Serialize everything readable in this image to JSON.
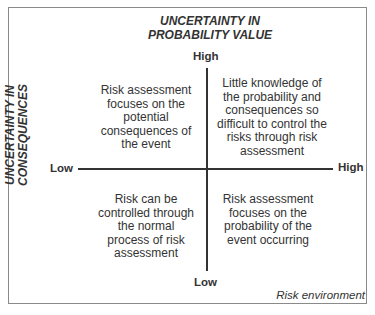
{
  "diagram": {
    "top_axis_title": "UNCERTAINTY IN PROBABILITY VALUE",
    "top_axis_title_lines": [
      "UNCERTAINTY IN",
      "PROBABILITY VALUE"
    ],
    "left_axis_title": "UNCERTAINTY IN CONSEQUENCES",
    "left_axis_title_lines": [
      "UNCERTAINTY IN",
      "CONSEQUENCES"
    ],
    "vertical_high": "High",
    "vertical_low": "Low",
    "horizontal_low": "Low",
    "horizontal_high": "High",
    "quadrants": {
      "top_left": "Risk assessment focuses on the potential consequences of the event",
      "top_right": "Little knowledge of the probability and consequences so difficult to control the risks through risk assessment",
      "bottom_left": "Risk can be controlled through the normal process of risk assessment",
      "bottom_right": "Risk assessment focuses on the probability of the event occurring"
    },
    "footer": "Risk environment"
  }
}
